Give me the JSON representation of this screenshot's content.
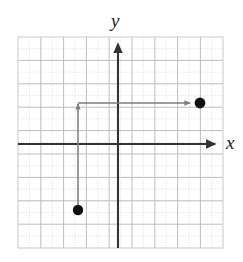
{
  "figure": {
    "background_color": "#ffffff",
    "width": 243,
    "height": 262
  },
  "axes": {
    "x_label": "x",
    "y_label": "y",
    "axis_color": "#333333",
    "x_axis_y_px": 144,
    "y_axis_x_px": 118,
    "x_axis_arrow_tip_px": 218,
    "y_axis_arrow_tip_px": 40
  },
  "grid": {
    "left_px": 18,
    "top_px": 37,
    "right_px": 223,
    "bottom_px": 248,
    "columns": 9,
    "rows": 9,
    "cell_width_px": 22.8,
    "cell_height_px": 23.4,
    "major_line_color": "#b9b9b9",
    "minor_line_color": "#dddddd",
    "border_color": "#c9c9c9"
  },
  "chart_data": {
    "type": "scatter",
    "title": "",
    "xlabel": "x",
    "ylabel": "y",
    "xlim": [
      -4.4,
      4.6
    ],
    "ylim": [
      -4.45,
      4.55
    ],
    "grid": true,
    "legend": "none",
    "points": [
      {
        "name": "point-b",
        "x": -1.75,
        "y": -2.8,
        "px_x": 78,
        "px_y": 210,
        "radius_px": 5.2,
        "color": "#111111",
        "filled": true
      },
      {
        "name": "point-a",
        "x": 3.6,
        "y": 1.75,
        "px_x": 200,
        "px_y": 103,
        "radius_px": 5.4,
        "color": "#111111",
        "filled": true
      }
    ],
    "annotations": [
      {
        "name": "vertical-translation-arrow",
        "type": "arrow",
        "from_px": [
          78,
          208
        ],
        "to_px": [
          78,
          101
        ],
        "direction": "up",
        "color": "#7d7d7d"
      },
      {
        "name": "horizontal-translation-arrow",
        "type": "arrow",
        "from_px": [
          78,
          103
        ],
        "to_px": [
          193,
          103
        ],
        "direction": "right",
        "color": "#7d7d7d"
      }
    ]
  },
  "colors": {
    "ink": "#1a1a1a",
    "axis": "#333333",
    "path": "#7d7d7d",
    "point": "#111111"
  }
}
